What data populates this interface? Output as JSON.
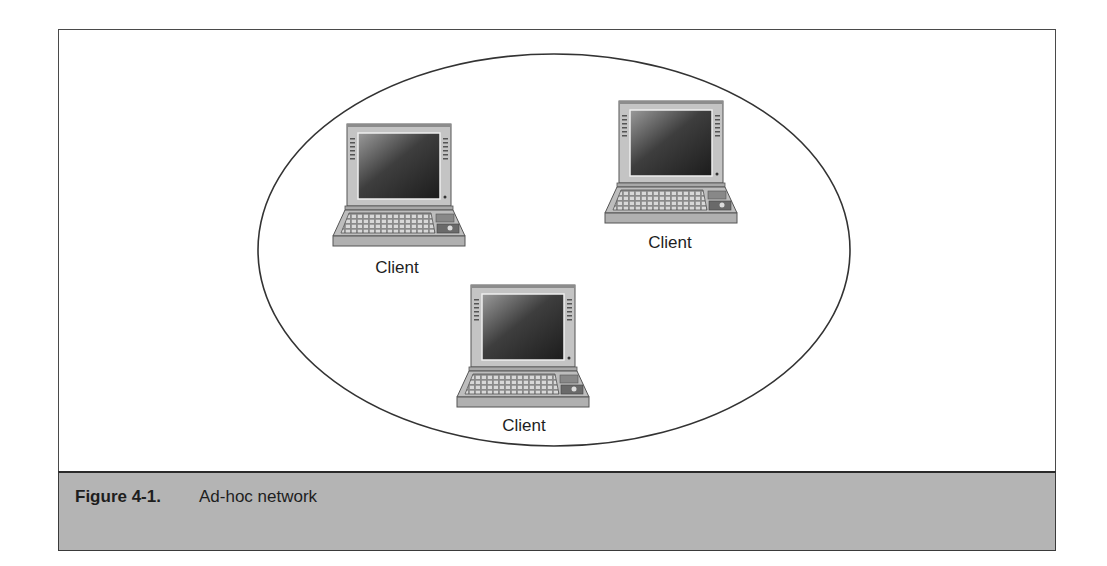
{
  "figure": {
    "caption_number": "Figure 4-1.",
    "caption_title": "Ad-hoc network",
    "caption_background": "#b4b4b4"
  },
  "diagram": {
    "type": "ad-hoc network",
    "boundary_shape": "ellipse",
    "nodes": [
      {
        "id": "client-1",
        "label": "Client",
        "icon": "laptop-icon"
      },
      {
        "id": "client-2",
        "label": "Client",
        "icon": "laptop-icon"
      },
      {
        "id": "client-3",
        "label": "Client",
        "icon": "laptop-icon"
      }
    ]
  }
}
